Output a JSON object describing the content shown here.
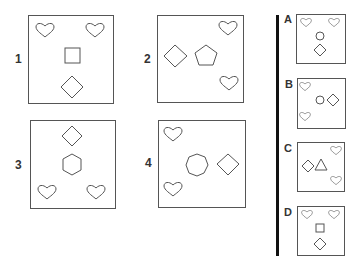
{
  "puzzle": {
    "question_panels": [
      {
        "label": "1",
        "shapes": [
          "heart",
          "heart",
          "square",
          "diamond"
        ]
      },
      {
        "label": "2",
        "shapes": [
          "diamond",
          "pentagon",
          "heart",
          "heart"
        ]
      },
      {
        "label": "3",
        "shapes": [
          "diamond",
          "hexagon",
          "heart",
          "heart"
        ]
      },
      {
        "label": "4",
        "shapes": [
          "heart",
          "heptagon",
          "diamond",
          "heart"
        ]
      }
    ],
    "answer_options": [
      {
        "label": "A",
        "shapes": [
          "heart",
          "heart",
          "circle",
          "diamond"
        ]
      },
      {
        "label": "B",
        "shapes": [
          "heart",
          "circle",
          "diamond",
          "heart"
        ]
      },
      {
        "label": "C",
        "shapes": [
          "heart",
          "diamond",
          "triangle",
          "heart"
        ]
      },
      {
        "label": "D",
        "shapes": [
          "heart",
          "heart",
          "square",
          "diamond"
        ]
      }
    ]
  },
  "colors": {
    "outline": "#555555",
    "divider": "#111111",
    "background": "#ffffff"
  }
}
